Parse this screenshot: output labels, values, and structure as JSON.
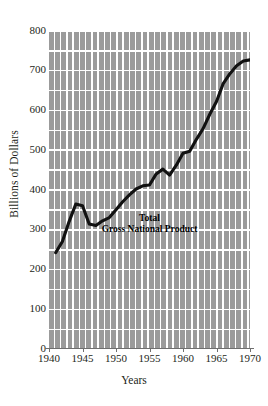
{
  "chart_data": {
    "type": "line",
    "title": "",
    "xlabel": "Years",
    "ylabel": "Billions of Dollars",
    "xlim": [
      1940,
      1970
    ],
    "ylim": [
      0,
      800
    ],
    "xticks": [
      1940,
      1945,
      1950,
      1955,
      1960,
      1965,
      1970
    ],
    "yticks": [
      0,
      100,
      200,
      300,
      400,
      500,
      600,
      700,
      800
    ],
    "grid": true,
    "legend_position": "none",
    "annotations": [
      {
        "line1": "Total",
        "line2": "Gross National Product",
        "x": 1955,
        "y": 318
      }
    ],
    "series": [
      {
        "name": "Total Gross National Product",
        "color": "#111111",
        "x": [
          1941,
          1942,
          1943,
          1944,
          1945,
          1946,
          1947,
          1948,
          1949,
          1950,
          1951,
          1952,
          1953,
          1954,
          1955,
          1956,
          1957,
          1958,
          1959,
          1960,
          1961,
          1962,
          1963,
          1964,
          1965,
          1966,
          1967,
          1968,
          1969,
          1970
        ],
        "values": [
          240,
          268,
          318,
          362,
          358,
          312,
          308,
          320,
          328,
          348,
          368,
          385,
          400,
          408,
          410,
          438,
          450,
          435,
          460,
          490,
          495,
          525,
          552,
          588,
          620,
          665,
          690,
          710,
          722,
          725
        ]
      }
    ]
  },
  "axes": {
    "y_tick_labels": [
      "800",
      "700",
      "600",
      "500",
      "400",
      "300",
      "200",
      "100",
      "0"
    ],
    "x_tick_labels": [
      "1940",
      "1945",
      "1950",
      "1955",
      "1960",
      "1965",
      "1970"
    ],
    "y_axis_title": "Billions of Dollars",
    "x_axis_title": "Years"
  },
  "colors": {
    "background": "#ffffff",
    "grid_bar": "#9b9b9b",
    "line": "#111111",
    "text": "#231f20",
    "axis": "#6f6f6f"
  }
}
